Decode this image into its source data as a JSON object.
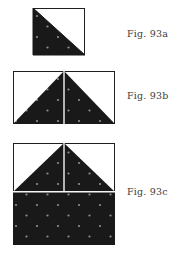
{
  "page": {
    "background": "#ffffff"
  },
  "colors": {
    "shape_fill": "#191919",
    "dot_color": "#8f8f8f",
    "outline": "#1f1f1f",
    "divider": "#f6f6f6",
    "label_text": "#3c3c3c"
  },
  "figures": [
    {
      "id": "fig-93a",
      "label": "Fig. 93a",
      "description": "outlined square with shaded dotted right triangle filling the lower-left half, hypotenuse from top-left to bottom-right"
    },
    {
      "id": "fig-93b",
      "label": "Fig. 93b",
      "description": "outlined wide rectangle with shaded dotted isosceles triangle (apex top center, base full bottom edge) split by a thin light vertical line"
    },
    {
      "id": "fig-93c",
      "label": "Fig. 93c",
      "description": "outlined square: top half holds shaded dotted isosceles triangle split by thin light vertical line, bottom half is a fully shaded dotted rectangle, separated by a thin light horizontal line"
    }
  ]
}
